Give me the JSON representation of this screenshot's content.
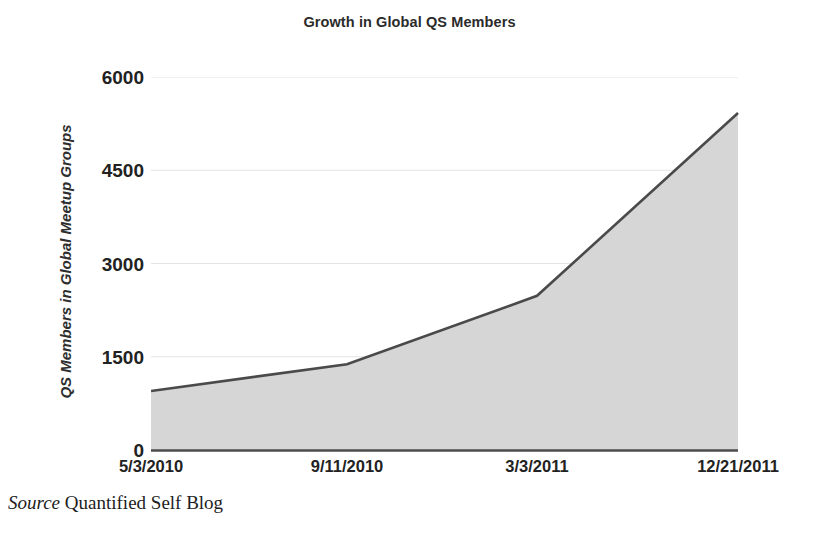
{
  "chart_data": {
    "type": "area",
    "title": "Growth in Global QS Members",
    "xlabel": "",
    "ylabel": "QS Members in Global Meetup Groups",
    "categories": [
      "5/3/2010",
      "9/11/2010",
      "3/3/2011",
      "12/21/2011"
    ],
    "x_tick_labels": [
      "5/3/2010",
      "9/11/2010",
      "3/3/2011",
      "12/21/2011"
    ],
    "y_tick_labels": [
      "0",
      "1500",
      "3000",
      "4500",
      "6000"
    ],
    "y_ticks": [
      0,
      1500,
      3000,
      4500,
      6000
    ],
    "ylim": [
      0,
      6000
    ],
    "xlim": [
      "5/3/2010",
      "12/21/2011"
    ],
    "grid": true,
    "grid_axis": "y",
    "legend": false,
    "legend_position": "none",
    "series": [
      {
        "name": "QS Members in Global Meetup Groups",
        "x": [
          "5/3/2010",
          "9/11/2010",
          "3/3/2011",
          "12/21/2011"
        ],
        "values": [
          950,
          1380,
          2480,
          5420
        ]
      }
    ],
    "colors": {
      "area_fill": "#d6d6d6",
      "line": "#4a4a4a",
      "grid": "#e2e2e2",
      "axis": "#5a5a5a",
      "text": "#222222"
    }
  },
  "source": {
    "label": "Source",
    "value": "Quantified Self Blog"
  }
}
